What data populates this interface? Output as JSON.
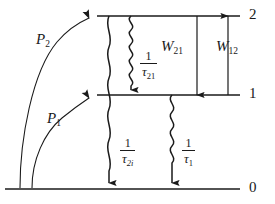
{
  "figure": {
    "type": "energy-level-diagram",
    "background_color": "#ffffff",
    "line_color": "#1a1a1a",
    "width": 275,
    "height": 204
  },
  "levels": [
    {
      "id": "level-2",
      "label": "2",
      "y": 16,
      "x_start": 97,
      "x_end": 240,
      "label_x": 249,
      "label_y": 8
    },
    {
      "id": "level-1",
      "label": "1",
      "y": 95,
      "x_start": 97,
      "x_end": 240,
      "label_x": 249,
      "label_y": 87
    },
    {
      "id": "level-0",
      "label": "0",
      "y": 189,
      "x_start": 5,
      "x_end": 240,
      "label_x": 249,
      "label_y": 181
    }
  ],
  "pump_arrows": [
    {
      "id": "pump-2",
      "label": "P",
      "subscript": "2",
      "from_level": "0",
      "to_level": "2",
      "label_x": 36,
      "label_y": 33
    },
    {
      "id": "pump-1",
      "label": "P",
      "subscript": "1",
      "from_level": "0",
      "to_level": "1",
      "label_x": 47,
      "label_y": 112
    }
  ],
  "transition_arrows": [
    {
      "id": "w21",
      "label": "W",
      "subscript": "21",
      "direction": "down",
      "from_level": "2",
      "to_level": "1",
      "x": 197,
      "label_x": 161,
      "label_y": 40
    },
    {
      "id": "w12",
      "label": "W",
      "subscript": "12",
      "direction": "up",
      "from_level": "1",
      "to_level": "2",
      "x": 228,
      "label_x": 216,
      "label_y": 40
    }
  ],
  "decay_arrows": [
    {
      "id": "tau-21",
      "numerator": "1",
      "denominator": "τ",
      "subscript": "21",
      "subscript_italic": false,
      "style": "wavy-tight",
      "direction": "down",
      "from_level": "2",
      "to_level": "1",
      "x": 131,
      "label_x": 140,
      "label_y": 50
    },
    {
      "id": "tau-2i",
      "numerator": "1",
      "denominator": "τ",
      "subscript": "2i",
      "subscript_italic": true,
      "style": "wavy-wide",
      "direction": "down",
      "from_level": "2",
      "to_level": "0",
      "x": 109,
      "label_x": 120,
      "label_y": 137
    },
    {
      "id": "tau-1",
      "numerator": "1",
      "denominator": "τ",
      "subscript": "1",
      "subscript_italic": false,
      "style": "wavy-tight",
      "direction": "down",
      "from_level": "1",
      "to_level": "0",
      "x": 172,
      "label_x": 182,
      "label_y": 137
    }
  ]
}
